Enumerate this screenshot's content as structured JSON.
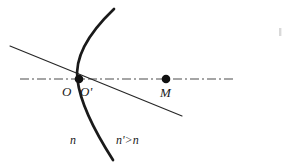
{
  "figure": {
    "background_color": "#ffffff",
    "ink_color": "#1a1a1a",
    "width": 288,
    "height": 165,
    "labels": {
      "vertex_left": "O",
      "vertex_right": "O'",
      "image_point": "M",
      "index_left": "n",
      "index_right": "n'>n"
    },
    "points": [
      {
        "name": "O",
        "x": 79,
        "y": 79,
        "radius": 4.2,
        "filled": true
      },
      {
        "name": "M",
        "x": 166,
        "y": 79,
        "radius": 4.2,
        "filled": true
      }
    ],
    "optical_axis": {
      "name": "optical-axis",
      "style": "dash-dot",
      "x1": 20,
      "y1": 79,
      "x2": 236,
      "y2": 79,
      "width": 1.1
    },
    "oblique_ray": {
      "name": "oblique-ray",
      "style": "solid",
      "x1": 10,
      "y1": 46,
      "x2": 182,
      "y2": 116,
      "width": 1.1
    },
    "refracting_surface": {
      "name": "refracting-surface",
      "style": "solid",
      "width": 2.6,
      "start_x": 114,
      "start_y": 9,
      "control_x": 45,
      "control_y": 84,
      "end_x": 113,
      "end_y": 160
    },
    "artifact": {
      "name": "scan-speck",
      "x": 280,
      "y": 30,
      "width": 3,
      "height": 8
    }
  }
}
